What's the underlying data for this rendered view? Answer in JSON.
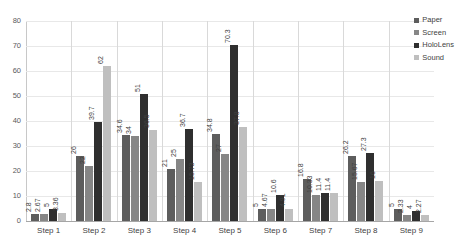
{
  "chart_data": {
    "type": "bar",
    "title": "",
    "xlabel": "",
    "ylabel": "",
    "ylim": [
      0,
      80
    ],
    "ytick_step": 10,
    "yticks": [
      "80",
      "70",
      "60",
      "50",
      "40",
      "30",
      "20",
      "10",
      "0"
    ],
    "grid": true,
    "legend_position": "top-right",
    "categories": [
      "Step 1",
      "Step 2",
      "Step 3",
      "Step 4",
      "Step 5",
      "Step 6",
      "Step 7",
      "Step 8",
      "Step 9"
    ],
    "series": [
      {
        "name": "Paper",
        "color": "#5d5d5d",
        "values": [
          2.8,
          26,
          34.6,
          21,
          34.8,
          5,
          16.8,
          26.2,
          5
        ]
      },
      {
        "name": "Screen",
        "color": "#868686",
        "values": [
          2.67,
          22,
          34,
          25,
          27,
          4.67,
          10.33,
          15.67,
          2.33
        ]
      },
      {
        "name": "HoloLens",
        "color": "#2f2f2f",
        "values": [
          5,
          39.7,
          51,
          36.7,
          70.3,
          10.6,
          11.4,
          27.3,
          4
        ]
      },
      {
        "name": "Sound",
        "color": "#bfbfbf",
        "values": [
          3.36,
          62,
          36.5,
          15.73,
          37.8,
          4.91,
          11.4,
          16,
          2.27
        ]
      }
    ],
    "value_labels": [
      [
        "2.8",
        "2.67",
        "5",
        "3.36"
      ],
      [
        "26",
        "22",
        "39.7",
        "62"
      ],
      [
        "34.6",
        "34",
        "51",
        "36.5"
      ],
      [
        "21",
        "25",
        "36.7",
        "15.73"
      ],
      [
        "34.8",
        "27",
        "70.3",
        "37.8"
      ],
      [
        "5",
        "4.67",
        "10.6",
        "4.91"
      ],
      [
        "16.8",
        "10.33",
        "11.4",
        "11.4"
      ],
      [
        "26.2",
        "15.67",
        "27.3",
        "16"
      ],
      [
        "5",
        "2.33",
        "4",
        "2.27"
      ]
    ]
  }
}
